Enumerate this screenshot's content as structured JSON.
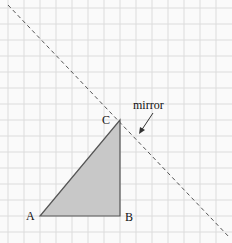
{
  "diagram": {
    "labels": {
      "a": "A",
      "b": "B",
      "c": "C",
      "mirror": "mirror"
    },
    "colors": {
      "grid": "#dcdcdc",
      "triangle_fill": "#c8c8c8",
      "triangle_stroke": "#555555",
      "mirror_line": "#555555"
    }
  }
}
